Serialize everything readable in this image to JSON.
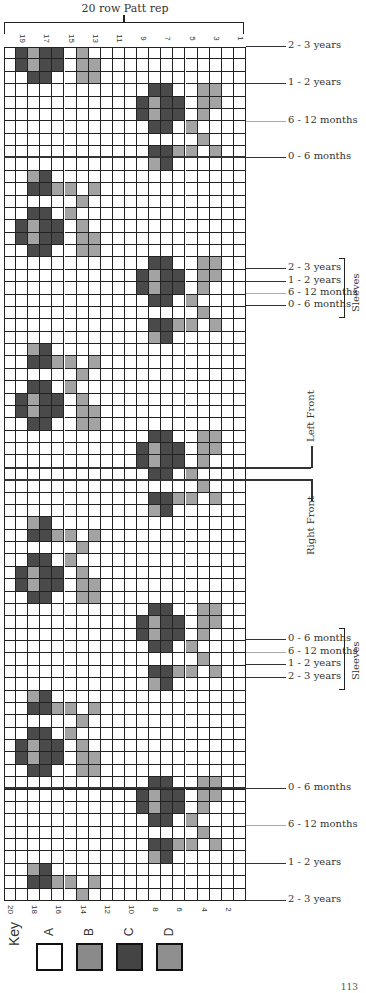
{
  "header": {
    "title": "20 row Patt rep"
  },
  "colors": {
    "A": "#ffffff",
    "B": "#a3a3a3",
    "C": "#4a4a4a",
    "D": "#9a9a9a",
    "grid_line": "#222222"
  },
  "grid": {
    "columns": 20,
    "rows": 69,
    "top_column_labels": [
      "19",
      "17",
      "15",
      "13",
      "11",
      "9",
      "7",
      "5",
      "3",
      "1"
    ],
    "bottom_column_labels": [
      "20",
      "18",
      "16",
      "14",
      "12",
      "10",
      "8",
      "6",
      "4",
      "2"
    ],
    "pattern_period": 14,
    "pattern_rows": [
      [
        [
          1,
          "C"
        ],
        [
          2,
          "B"
        ],
        [
          3,
          "C"
        ],
        [
          4,
          "C"
        ],
        [
          6,
          "B"
        ]
      ],
      [
        [
          1,
          "C"
        ],
        [
          2,
          "B"
        ],
        [
          3,
          "C"
        ],
        [
          4,
          "C"
        ],
        [
          6,
          "B"
        ],
        [
          7,
          "B"
        ]
      ],
      [
        [
          2,
          "C"
        ],
        [
          3,
          "C"
        ],
        [
          6,
          "B"
        ],
        [
          7,
          "B"
        ]
      ],
      [
        [
          12,
          "C"
        ],
        [
          13,
          "C"
        ],
        [
          16,
          "B"
        ],
        [
          17,
          "B"
        ]
      ],
      [
        [
          11,
          "C"
        ],
        [
          12,
          "B"
        ],
        [
          13,
          "C"
        ],
        [
          14,
          "C"
        ],
        [
          16,
          "B"
        ],
        [
          17,
          "B"
        ]
      ],
      [
        [
          11,
          "C"
        ],
        [
          12,
          "B"
        ],
        [
          13,
          "C"
        ],
        [
          14,
          "C"
        ],
        [
          16,
          "B"
        ]
      ],
      [
        [
          12,
          "C"
        ],
        [
          13,
          "C"
        ],
        [
          15,
          "B"
        ]
      ],
      [
        [
          16,
          "B"
        ]
      ],
      [
        [
          12,
          "C"
        ],
        [
          13,
          "C"
        ],
        [
          14,
          "B"
        ],
        [
          15,
          "B"
        ],
        [
          17,
          "B"
        ]
      ],
      [
        [
          12,
          "B"
        ],
        [
          13,
          "C"
        ]
      ],
      [
        [
          2,
          "B"
        ],
        [
          3,
          "C"
        ]
      ],
      [
        [
          2,
          "C"
        ],
        [
          3,
          "C"
        ],
        [
          4,
          "B"
        ],
        [
          5,
          "B"
        ],
        [
          7,
          "B"
        ]
      ],
      [
        [
          6,
          "B"
        ]
      ],
      [
        [
          2,
          "C"
        ],
        [
          3,
          "C"
        ],
        [
          5,
          "B"
        ]
      ]
    ]
  },
  "right_labels": [
    {
      "text": "2 - 3 years",
      "y": 46
    },
    {
      "text": "1 - 2 years",
      "y": 83
    },
    {
      "text": "6 - 12 months",
      "y": 121
    },
    {
      "text": "0 - 6 months",
      "y": 157
    },
    {
      "text": "2 - 3 years",
      "y": 268
    },
    {
      "text": "1 - 2 years",
      "y": 281
    },
    {
      "text": "6 - 12 months",
      "y": 293
    },
    {
      "text": "0 - 6 months",
      "y": 305
    },
    {
      "text": "0 - 6 months",
      "y": 639
    },
    {
      "text": "6 - 12 months",
      "y": 652
    },
    {
      "text": "1 - 2 years",
      "y": 664
    },
    {
      "text": "2 - 3 years",
      "y": 677
    },
    {
      "text": "0 - 6 months",
      "y": 788
    },
    {
      "text": "6 - 12 months",
      "y": 825
    },
    {
      "text": "1 - 2 years",
      "y": 863
    },
    {
      "text": "2 - 3 years",
      "y": 900
    }
  ],
  "groups": {
    "sleeves_top": "Sleeves",
    "left_front": "Left Front",
    "right_front": "Right Front",
    "sleeves_bottom": "Sleeves"
  },
  "key": {
    "title": "Key",
    "items": [
      {
        "letter": "A",
        "color": "#ffffff"
      },
      {
        "letter": "B",
        "color": "#8a8a8a"
      },
      {
        "letter": "C",
        "color": "#444444"
      },
      {
        "letter": "D",
        "color": "#8f8f8f"
      }
    ]
  },
  "page_number": "113"
}
